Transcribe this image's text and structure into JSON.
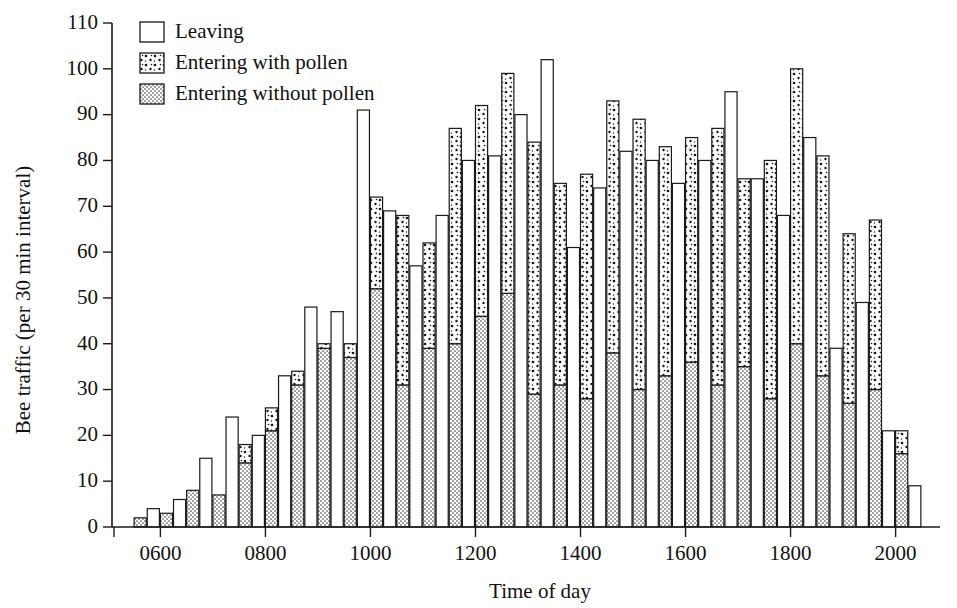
{
  "chart_data": {
    "type": "bar",
    "title": "",
    "subtitle": "",
    "xlabel": "Time of day",
    "ylabel": "Bee traffic (per 30 min interval)",
    "ylim": [
      0,
      110
    ],
    "ytick_values": [
      0,
      10,
      20,
      30,
      40,
      50,
      60,
      70,
      80,
      90,
      100,
      110
    ],
    "ytick_labels": [
      "0",
      "10",
      "20",
      "30",
      "40",
      "50",
      "60",
      "70",
      "80",
      "90",
      "100",
      "110"
    ],
    "xlim": [
      "0500",
      "2100"
    ],
    "xtick_values": [
      "0600",
      "0800",
      "1000",
      "1200",
      "1400",
      "1600",
      "1800",
      "2000"
    ],
    "xtick_labels": [
      "0600",
      "0800",
      "1000",
      "1200",
      "1400",
      "1600",
      "1800",
      "2000"
    ],
    "grid": false,
    "legend_position": "top-left",
    "bar_grouping": "paired: leaving bar then stacked entering bar per 30-min interval",
    "series": [
      {
        "name": "Leaving",
        "fill": "white",
        "pattern": "none"
      },
      {
        "name": "Entering with pollen",
        "fill": "sparse-dots",
        "pattern": "sparse"
      },
      {
        "name": "Entering without pollen",
        "fill": "fine-stipple",
        "pattern": "dense"
      }
    ],
    "legend_entries": [
      "Leaving",
      "Entering with pollen",
      "Entering without pollen"
    ],
    "categories": [
      "0530",
      "0600",
      "0630",
      "0700",
      "0730",
      "0800",
      "0830",
      "0900",
      "0930",
      "1000",
      "1030",
      "1100",
      "1130",
      "1200",
      "1230",
      "1300",
      "1330",
      "1400",
      "1430",
      "1500",
      "1530",
      "1600",
      "1630",
      "1700",
      "1730",
      "1800",
      "1830",
      "1900",
      "1930",
      "2000",
      "2030"
    ],
    "intervals": [
      {
        "time": "0530",
        "leaving": 0,
        "entering_without_pollen": 2,
        "entering_with_pollen": 0
      },
      {
        "time": "0600",
        "leaving": 4,
        "entering_without_pollen": 3,
        "entering_with_pollen": 0
      },
      {
        "time": "0630",
        "leaving": 6,
        "entering_without_pollen": 8,
        "entering_with_pollen": 0
      },
      {
        "time": "0700",
        "leaving": 15,
        "entering_without_pollen": 7,
        "entering_with_pollen": 0
      },
      {
        "time": "0730",
        "leaving": 24,
        "entering_without_pollen": 14,
        "entering_with_pollen": 4
      },
      {
        "time": "0800",
        "leaving": 20,
        "entering_without_pollen": 21,
        "entering_with_pollen": 5
      },
      {
        "time": "0830",
        "leaving": 33,
        "entering_without_pollen": 31,
        "entering_with_pollen": 3
      },
      {
        "time": "0900",
        "leaving": 48,
        "entering_without_pollen": 39,
        "entering_with_pollen": 1
      },
      {
        "time": "0930",
        "leaving": 47,
        "entering_without_pollen": 37,
        "entering_with_pollen": 3
      },
      {
        "time": "1000",
        "leaving": 91,
        "entering_without_pollen": 52,
        "entering_with_pollen": 20
      },
      {
        "time": "1030",
        "leaving": 69,
        "entering_without_pollen": 31,
        "entering_with_pollen": 37
      },
      {
        "time": "1100",
        "leaving": 57,
        "entering_without_pollen": 39,
        "entering_with_pollen": 23
      },
      {
        "time": "1130",
        "leaving": 68,
        "entering_without_pollen": 40,
        "entering_with_pollen": 47
      },
      {
        "time": "1200",
        "leaving": 80,
        "entering_without_pollen": 46,
        "entering_with_pollen": 46
      },
      {
        "time": "1230",
        "leaving": 81,
        "entering_without_pollen": 51,
        "entering_with_pollen": 48
      },
      {
        "time": "1300",
        "leaving": 90,
        "entering_without_pollen": 29,
        "entering_with_pollen": 55
      },
      {
        "time": "1330",
        "leaving": 102,
        "entering_without_pollen": 31,
        "entering_with_pollen": 44
      },
      {
        "time": "1400",
        "leaving": 61,
        "entering_without_pollen": 28,
        "entering_with_pollen": 49
      },
      {
        "time": "1430",
        "leaving": 74,
        "entering_without_pollen": 38,
        "entering_with_pollen": 55
      },
      {
        "time": "1500",
        "leaving": 82,
        "entering_without_pollen": 30,
        "entering_with_pollen": 59
      },
      {
        "time": "1530",
        "leaving": 80,
        "entering_without_pollen": 33,
        "entering_with_pollen": 50
      },
      {
        "time": "1600",
        "leaving": 75,
        "entering_without_pollen": 36,
        "entering_with_pollen": 49
      },
      {
        "time": "1630",
        "leaving": 80,
        "entering_without_pollen": 31,
        "entering_with_pollen": 56
      },
      {
        "time": "1700",
        "leaving": 95,
        "entering_without_pollen": 35,
        "entering_with_pollen": 41
      },
      {
        "time": "1730",
        "leaving": 76,
        "entering_without_pollen": 28,
        "entering_with_pollen": 52
      },
      {
        "time": "1800",
        "leaving": 68,
        "entering_without_pollen": 40,
        "entering_with_pollen": 60
      },
      {
        "time": "1830",
        "leaving": 85,
        "entering_without_pollen": 33,
        "entering_with_pollen": 48
      },
      {
        "time": "1900",
        "leaving": 39,
        "entering_without_pollen": 27,
        "entering_with_pollen": 37
      },
      {
        "time": "1930",
        "leaving": 49,
        "entering_without_pollen": 30,
        "entering_with_pollen": 37
      },
      {
        "time": "2000",
        "leaving": 21,
        "entering_without_pollen": 16,
        "entering_with_pollen": 5
      },
      {
        "time": "2030",
        "leaving": 9,
        "entering_without_pollen": 0,
        "entering_with_pollen": 0
      }
    ]
  }
}
